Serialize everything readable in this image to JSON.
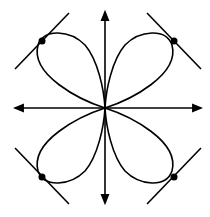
{
  "diagram": {
    "title": "",
    "type": "polar-curve-four-leaved-rose",
    "stroke_color": "#000000",
    "background": "#ffffff",
    "origin": [
      105,
      108
    ],
    "axes": {
      "x": {
        "from": [
          15,
          108
        ],
        "to": [
          201,
          108
        ],
        "arrows": "both"
      },
      "y": {
        "from": [
          105,
          12
        ],
        "to": [
          105,
          203
        ],
        "arrows": "both"
      }
    },
    "petals": [
      {
        "name": "upper-left",
        "tip": [
          42,
          41
        ]
      },
      {
        "name": "upper-right",
        "tip": [
          174,
          41
        ]
      },
      {
        "name": "lower-left",
        "tip": [
          42,
          177
        ]
      },
      {
        "name": "lower-right",
        "tip": [
          174,
          177
        ]
      }
    ],
    "tangent_lines": [
      {
        "name": "upper-left",
        "from": [
          15,
          69
        ],
        "to": [
          69,
          13
        ]
      },
      {
        "name": "upper-right",
        "from": [
          147,
          13
        ],
        "to": [
          201,
          69
        ]
      },
      {
        "name": "lower-left",
        "from": [
          15,
          148
        ],
        "to": [
          69,
          204
        ]
      },
      {
        "name": "lower-right",
        "from": [
          147,
          204
        ],
        "to": [
          201,
          148
        ]
      }
    ],
    "points": [
      {
        "name": "upper-left",
        "at": [
          42,
          41
        ]
      },
      {
        "name": "upper-right",
        "at": [
          174,
          41
        ]
      },
      {
        "name": "lower-left",
        "at": [
          42,
          177
        ]
      },
      {
        "name": "lower-right",
        "at": [
          174,
          177
        ]
      }
    ]
  }
}
